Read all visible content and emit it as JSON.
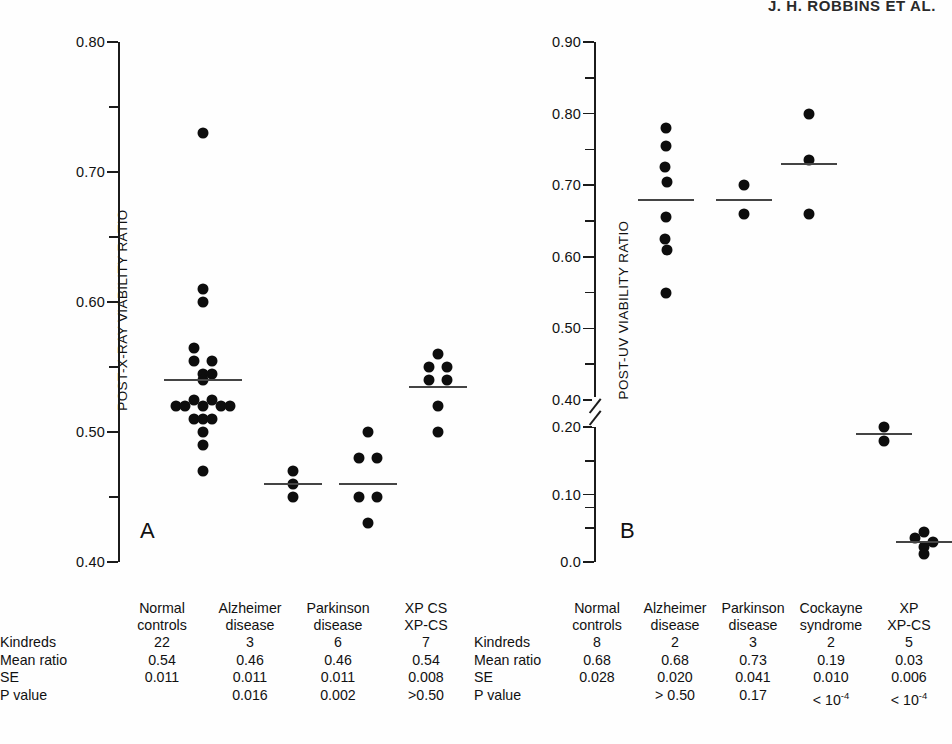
{
  "running_head": "J. H. ROBBINS ET AL.",
  "chart_data": [
    {
      "type": "scatter",
      "panel": "A",
      "title": "",
      "ylabel": "POST-X-RAY VIABILITY RATIO",
      "xlabel": "",
      "ylim": [
        0.4,
        0.8
      ],
      "yticks_major": [
        "0.40",
        "0.50",
        "0.60",
        "0.70",
        "0.80"
      ],
      "ytick_major_values": [
        0.4,
        0.5,
        0.6,
        0.7,
        0.8
      ],
      "ytick_minor_values": [
        0.45,
        0.55,
        0.65,
        0.75
      ],
      "grid": false,
      "legend": "none",
      "categories": [
        "Normal controls",
        "Alzheimer disease",
        "Parkinson disease",
        "XP CS XP-CS"
      ],
      "series": [
        {
          "name": "Normal controls",
          "mean": 0.54,
          "values": [
            0.73,
            0.61,
            0.6,
            0.565,
            0.555,
            0.555,
            0.545,
            0.545,
            0.54,
            0.525,
            0.525,
            0.52,
            0.52,
            0.52,
            0.52,
            0.52,
            0.51,
            0.51,
            0.51,
            0.5,
            0.49,
            0.47
          ]
        },
        {
          "name": "Alzheimer disease",
          "mean": 0.46,
          "values": [
            0.47,
            0.46,
            0.45
          ]
        },
        {
          "name": "Parkinson disease",
          "mean": 0.46,
          "values": [
            0.5,
            0.48,
            0.48,
            0.45,
            0.45,
            0.43
          ]
        },
        {
          "name": "XP CS XP-CS",
          "mean": 0.535,
          "values": [
            0.56,
            0.55,
            0.55,
            0.54,
            0.54,
            0.52,
            0.5
          ]
        }
      ]
    },
    {
      "type": "scatter",
      "panel": "B",
      "title": "",
      "ylabel": "POST-UV VIABILITY RATIO",
      "xlabel": "",
      "ylim": [
        0.0,
        0.9
      ],
      "axis_break": "between 0.40 and 0.20",
      "yticks_major": [
        "0.0",
        "0.10",
        "0.20",
        "0.40",
        "0.50",
        "0.60",
        "0.70",
        "0.80",
        "0.90"
      ],
      "ytick_major_values": [
        0.0,
        0.1,
        0.2,
        0.4,
        0.5,
        0.6,
        0.7,
        0.8,
        0.9
      ],
      "ytick_minor_values": [
        0.05,
        0.15,
        0.25,
        0.45,
        0.55,
        0.65,
        0.75,
        0.85
      ],
      "grid": false,
      "legend": "none",
      "categories": [
        "Normal controls",
        "Alzheimer disease",
        "Parkinson disease",
        "Cockayne syndrome",
        "XP XP-CS"
      ],
      "series": [
        {
          "name": "Normal controls",
          "mean": 0.68,
          "values": [
            0.78,
            0.755,
            0.725,
            0.705,
            0.655,
            0.625,
            0.61,
            0.55
          ]
        },
        {
          "name": "Alzheimer disease",
          "mean": 0.68,
          "values": [
            0.7,
            0.66
          ]
        },
        {
          "name": "Parkinson disease",
          "mean": 0.73,
          "values": [
            0.8,
            0.735,
            0.66
          ]
        },
        {
          "name": "Cockayne syndrome",
          "mean": 0.19,
          "values": [
            0.2,
            0.18
          ]
        },
        {
          "name": "XP XP-CS",
          "mean": 0.03,
          "values": [
            0.045,
            0.035,
            0.03,
            0.022,
            0.012
          ]
        }
      ]
    }
  ],
  "panel_a": {
    "letter": "A",
    "ylabel": "POST-X-RAY VIABILITY RATIO",
    "ticklabels": [
      "0.80",
      "0.70",
      "0.60",
      "0.50",
      "0.40"
    ],
    "table": {
      "row_labels": [
        "Kindreds",
        "Mean ratio",
        "SE",
        "P value"
      ],
      "columns": [
        {
          "header_line1": "Normal",
          "header_line2": "controls",
          "kindreds": "22",
          "mean_ratio": "0.54",
          "se": "0.011",
          "p_value": ""
        },
        {
          "header_line1": "Alzheimer",
          "header_line2": "disease",
          "kindreds": "3",
          "mean_ratio": "0.46",
          "se": "0.011",
          "p_value": "0.016"
        },
        {
          "header_line1": "Parkinson",
          "header_line2": "disease",
          "kindreds": "6",
          "mean_ratio": "0.46",
          "se": "0.011",
          "p_value": "0.002"
        },
        {
          "header_line1": "XP CS",
          "header_line2": "XP-CS",
          "kindreds": "7",
          "mean_ratio": "0.54",
          "se": "0.008",
          "p_value": ">0.50"
        }
      ]
    }
  },
  "panel_b": {
    "letter": "B",
    "ylabel": "POST-UV VIABILITY RATIO",
    "ticklabels": [
      "0.90",
      "0.80",
      "0.70",
      "0.60",
      "0.50",
      "0.40",
      "0.20",
      "0.10",
      "0.0"
    ],
    "table": {
      "row_labels": [
        "Kindreds",
        "Mean ratio",
        "SE",
        "P value"
      ],
      "columns": [
        {
          "header_line1": "Normal",
          "header_line2": "controls",
          "kindreds": "8",
          "mean_ratio": "0.68",
          "se": "0.028",
          "p_value": ""
        },
        {
          "header_line1": "Alzheimer",
          "header_line2": "disease",
          "kindreds": "2",
          "mean_ratio": "0.68",
          "se": "0.020",
          "p_value": "> 0.50"
        },
        {
          "header_line1": "Parkinson",
          "header_line2": "disease",
          "kindreds": "3",
          "mean_ratio": "0.73",
          "se": "0.041",
          "p_value": "0.17"
        },
        {
          "header_line1": "Cockayne",
          "header_line2": "syndrome",
          "kindreds": "2",
          "mean_ratio": "0.19",
          "se": "0.010",
          "p_value": "< 10⁻⁴"
        },
        {
          "header_line1": "XP",
          "header_line2": "XP-CS",
          "kindreds": "5",
          "mean_ratio": "0.03",
          "se": "0.006",
          "p_value": "< 10⁻⁴"
        }
      ]
    }
  },
  "colors": {
    "dot": "#0d0d0d",
    "axis": "#1b1b1b",
    "mean_bar": "#444444",
    "background": "#fefefe",
    "text": "#111111"
  }
}
